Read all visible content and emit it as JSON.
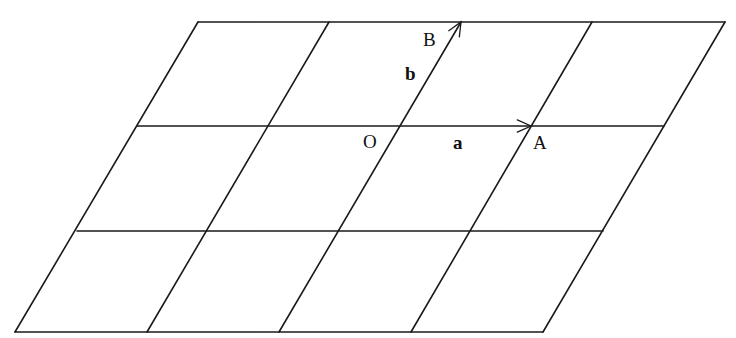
{
  "diagram": {
    "type": "parallelogram-lattice",
    "stroke_color": "#1a1a1a",
    "background": "#ffffff",
    "rows": [
      {
        "y": 22,
        "x": [
          198,
          329,
          461,
          592,
          725
        ]
      },
      {
        "y": 126,
        "x": [
          137,
          268,
          400,
          531,
          664
        ]
      },
      {
        "y": 231,
        "x": [
          77,
          208,
          340,
          472,
          603
        ]
      },
      {
        "y": 332,
        "x": [
          15,
          147,
          279,
          411,
          543
        ]
      }
    ],
    "points": {
      "O": {
        "label": "O",
        "x": 400,
        "y": 126
      },
      "A": {
        "label": "A",
        "x": 531,
        "y": 126
      },
      "B": {
        "label": "B",
        "x": 461,
        "y": 22
      }
    },
    "vectors": {
      "a": {
        "label": "a",
        "from": "O",
        "to": "A"
      },
      "b": {
        "label": "b",
        "from": "O",
        "to": "B"
      }
    },
    "labels": {
      "O": "O",
      "A": "A",
      "B": "B",
      "a": "a",
      "b": "b"
    }
  }
}
